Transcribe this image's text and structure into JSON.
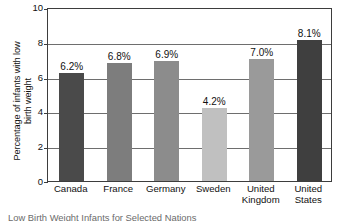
{
  "chart_data": {
    "type": "bar",
    "title": "",
    "xlabel": "",
    "ylabel": "Percentage of infants with low\nbirth weight",
    "ylim": [
      0,
      10
    ],
    "yticks": [
      "0",
      "2",
      "4",
      "6",
      "8",
      "10"
    ],
    "grid": true,
    "legend": "none",
    "categories": [
      "Canada",
      "France",
      "Germany",
      "Sweden",
      "United\nKingdom",
      "United\nStates"
    ],
    "values": [
      6.2,
      6.8,
      6.9,
      4.2,
      7.0,
      8.1
    ],
    "data_labels": [
      "6.2%",
      "6.8%",
      "6.9%",
      "4.2%",
      "7.0%",
      "8.1%"
    ],
    "bar_colors": [
      "#4a4a4a",
      "#7d7d7d",
      "#8c8c8c",
      "#c0c0c0",
      "#9a9a9a",
      "#3f3f3f"
    ]
  },
  "caption": {
    "text": "Low Birth Weight Infants for Selected Nations"
  },
  "axis": {
    "frame_color": "#3d3d3d",
    "grid_color": "#6e6e6e"
  }
}
